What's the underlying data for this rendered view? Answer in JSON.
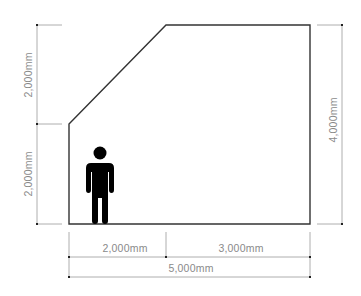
{
  "diagram": {
    "type": "room-section-dimension-drawing",
    "colors": {
      "outline": "#333333",
      "dimension_line": "#9a9a9a",
      "label": "#8a8a8a",
      "person": "#000000",
      "background": "#ffffff"
    },
    "dimensions": {
      "left_upper": {
        "label": "2,000mm",
        "orientation": "vertical"
      },
      "left_lower": {
        "label": "2,000mm",
        "orientation": "vertical"
      },
      "right_total": {
        "label": "4,000mm",
        "orientation": "vertical"
      },
      "bottom_left": {
        "label": "2,000mm",
        "orientation": "horizontal"
      },
      "bottom_right": {
        "label": "3,000mm",
        "orientation": "horizontal"
      },
      "bottom_total": {
        "label": "5,000mm",
        "orientation": "horizontal"
      }
    },
    "figure": {
      "icon": "person-icon"
    }
  }
}
